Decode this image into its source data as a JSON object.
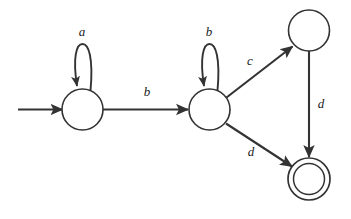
{
  "diagram": {
    "type": "state-transition-diagram",
    "stroke_color": "#333333",
    "label_color": "#1a1a1a",
    "background_color": "#ffffff",
    "states": [
      {
        "id": "q0",
        "name": "start-state",
        "label": "",
        "cx": 82.5,
        "cy": 109.5,
        "r": 20.5,
        "accepting": false,
        "start": true
      },
      {
        "id": "q1",
        "name": "middle-state",
        "label": "",
        "cx": 209.5,
        "cy": 109.5,
        "r": 20.5,
        "accepting": false,
        "start": false
      },
      {
        "id": "q2",
        "name": "upper-right-state",
        "label": "",
        "cx": 309,
        "cy": 30.5,
        "r": 20.5,
        "accepting": false,
        "start": false
      },
      {
        "id": "q3",
        "name": "accepting-state",
        "label": "",
        "cx": 309,
        "cy": 179,
        "r": 21,
        "inner_r": 15.5,
        "accepting": true,
        "start": false
      }
    ],
    "transitions": [
      {
        "id": "t-start",
        "name": "start-arrow",
        "from": "",
        "to": "q0",
        "label": "",
        "kind": "start-marker"
      },
      {
        "id": "t0",
        "name": "self-loop-a",
        "from": "q0",
        "to": "q0",
        "label": "a",
        "label_x": 82,
        "label_y": 33,
        "kind": "self-loop"
      },
      {
        "id": "t1",
        "name": "edge-q0-q1-b",
        "from": "q0",
        "to": "q1",
        "label": "b",
        "label_x": 147,
        "label_y": 93,
        "kind": "straight"
      },
      {
        "id": "t2",
        "name": "self-loop-b",
        "from": "q1",
        "to": "q1",
        "label": "b",
        "label_x": 209,
        "label_y": 33,
        "kind": "self-loop"
      },
      {
        "id": "t3",
        "name": "edge-q1-q2-c",
        "from": "q1",
        "to": "q2",
        "label": "c",
        "label_x": 250,
        "label_y": 62,
        "kind": "straight"
      },
      {
        "id": "t4",
        "name": "edge-q1-q3-d",
        "from": "q1",
        "to": "q3",
        "label": "d",
        "label_x": 251,
        "label_y": 153,
        "kind": "straight"
      },
      {
        "id": "t5",
        "name": "edge-q2-q3-d",
        "from": "q2",
        "to": "q3",
        "label": "d",
        "label_x": 321,
        "label_y": 105,
        "kind": "straight"
      }
    ],
    "alphabet": [
      "a",
      "b",
      "c",
      "d"
    ]
  }
}
